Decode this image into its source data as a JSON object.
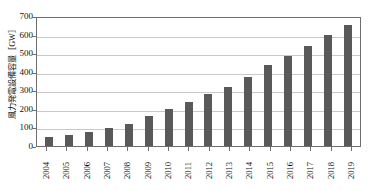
{
  "chart_data": {
    "type": "bar",
    "title": "",
    "subtitle": "",
    "xlabel": "",
    "ylabel": "風力発電設備容量［GW］",
    "categories": [
      "2004",
      "2005",
      "2006",
      "2007",
      "2008",
      "2009",
      "2010",
      "2011",
      "2012",
      "2013",
      "2014",
      "2015",
      "2016",
      "2017",
      "2018",
      "2019"
    ],
    "values": [
      48,
      60,
      75,
      95,
      120,
      160,
      200,
      238,
      282,
      318,
      370,
      435,
      487,
      540,
      600,
      650
    ],
    "series": [
      {
        "name": "風力発電設備容量",
        "values": [
          48,
          60,
          75,
          95,
          120,
          160,
          200,
          238,
          282,
          318,
          370,
          435,
          487,
          540,
          600,
          650
        ]
      }
    ],
    "ylim": [
      0,
      700
    ],
    "ytick_labels": [
      "0",
      "100",
      "200",
      "300",
      "400",
      "500",
      "600",
      "700"
    ],
    "ytick_values": [
      0,
      100,
      200,
      300,
      400,
      500,
      600,
      700
    ],
    "xtick_labels": [
      "2004",
      "2005",
      "2006",
      "2007",
      "2008",
      "2009",
      "2010",
      "2011",
      "2012",
      "2013",
      "2014",
      "2015",
      "2016",
      "2017",
      "2018",
      "2019"
    ],
    "grid": true,
    "grid_axis": "y",
    "legend": false,
    "legend_position": "none",
    "unit": "GW",
    "bar_color": "#595959",
    "gridline_color": "#c9c9c9",
    "axis_color": "#6e6e6e",
    "background_color": "#ffffff",
    "text_color": "#111111"
  }
}
